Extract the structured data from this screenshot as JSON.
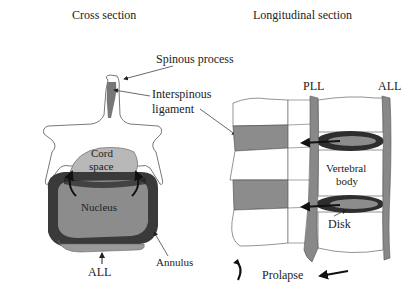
{
  "titles": {
    "cross_section": "Cross section",
    "longitudinal_section": "Longitudinal section"
  },
  "cross_section_labels": {
    "spinous_process": "Spinous process",
    "interspinous_ligament_line1": "Interspinous",
    "interspinous_ligament_line2": "ligament",
    "cord_space_line1": "Cord",
    "cord_space_line2": "space",
    "nucleus": "Nucleus",
    "annulus": "Annulus",
    "all": "ALL"
  },
  "longitudinal_labels": {
    "pll": "PLL",
    "all": "ALL",
    "vertebral_body_line1": "Vertebral",
    "vertebral_body_line2": "body",
    "disk": "Disk"
  },
  "legend": {
    "prolapse": "Prolapse"
  },
  "colors": {
    "bone_fill": "#ffffff",
    "outline": "#555555",
    "ligament_gray": "#8a8a8a",
    "cord_space": "#b5b5b5",
    "nucleus": "#8c8c8c",
    "annulus": "#3a3a3a",
    "arrow": "#222222"
  }
}
